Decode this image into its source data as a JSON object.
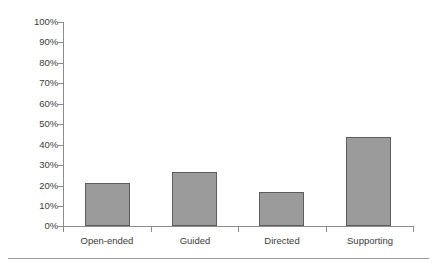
{
  "chart_data": {
    "type": "bar",
    "title": "",
    "subtitle": "",
    "xlabel": "",
    "ylabel": "",
    "categories": [
      "Open-ended",
      "Guided",
      "Directed",
      "Supporting"
    ],
    "values": [
      21,
      26.5,
      16.5,
      43.5
    ],
    "value_labels": [
      "21%",
      "26.5%",
      "16.5%",
      "43.5%"
    ],
    "ylim": [
      0,
      100
    ],
    "ytick_labels": [
      "0%",
      "10%",
      "20%",
      "30%",
      "40%",
      "50%",
      "60%",
      "70%",
      "80%",
      "90%",
      "100%"
    ],
    "ytick_values": [
      0,
      10,
      20,
      30,
      40,
      50,
      60,
      70,
      80,
      90,
      100
    ],
    "grid": false,
    "legend": false,
    "legend_position": "none",
    "series": [
      {
        "name": "",
        "values": [
          21,
          26.5,
          16.5,
          43.5
        ]
      }
    ],
    "colors": {
      "bar_fill": "#9b9b9b",
      "bar_border": "#5d5d5d",
      "axis": "#8c8c8c",
      "text": "#3c3c3c",
      "background": "#ffffff",
      "rule": "#9a9a9a"
    }
  }
}
